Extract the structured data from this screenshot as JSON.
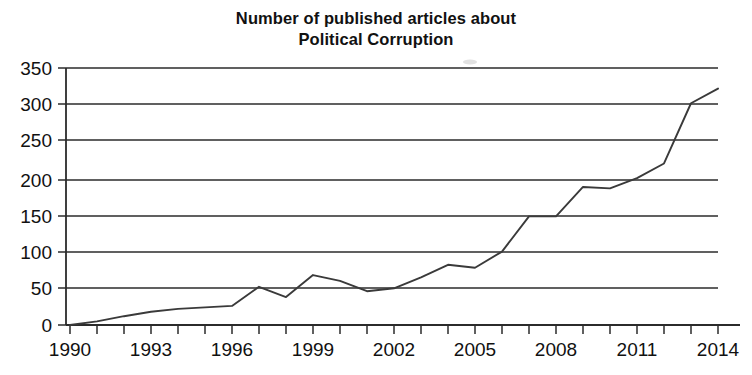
{
  "chart_data": {
    "type": "line",
    "title": "Number of published articles about Political Corruption",
    "title_lines": [
      "Number of published articles about",
      "Political Corruption"
    ],
    "xlabel": "",
    "ylabel": "",
    "x": [
      1990,
      1991,
      1992,
      1993,
      1994,
      1995,
      1996,
      1997,
      1998,
      1999,
      2000,
      2001,
      2002,
      2003,
      2004,
      2005,
      2006,
      2007,
      2008,
      2009,
      2010,
      2011,
      2012,
      2013,
      2014
    ],
    "values": [
      0,
      5,
      12,
      18,
      22,
      24,
      26,
      52,
      38,
      68,
      60,
      46,
      50,
      65,
      82,
      78,
      100,
      148,
      148,
      188,
      186,
      200,
      220,
      302,
      322
    ],
    "series": [
      {
        "name": "Published articles about Political Corruption",
        "values": [
          0,
          5,
          12,
          18,
          22,
          24,
          26,
          52,
          38,
          68,
          60,
          46,
          50,
          65,
          82,
          78,
          100,
          148,
          148,
          188,
          186,
          200,
          220,
          302,
          322
        ]
      }
    ],
    "xlim": [
      1990,
      2014
    ],
    "ylim": [
      0,
      350
    ],
    "y_ticks": [
      0,
      50,
      100,
      150,
      200,
      250,
      300,
      350
    ],
    "y_tick_labels": [
      "0",
      "50",
      "100",
      "150",
      "200",
      "250",
      "300",
      "350"
    ],
    "x_ticks": [
      1990,
      1991,
      1992,
      1993,
      1994,
      1995,
      1996,
      1997,
      1998,
      1999,
      2000,
      2001,
      2002,
      2003,
      2004,
      2005,
      2006,
      2007,
      2008,
      2009,
      2010,
      2011,
      2012,
      2013,
      2014
    ],
    "x_tick_labels": [
      "1990",
      "",
      "",
      "1993",
      "",
      "",
      "1996",
      "",
      "",
      "1999",
      "",
      "",
      "2002",
      "",
      "",
      "2005",
      "",
      "",
      "2008",
      "",
      "",
      "2011",
      "",
      "",
      "2014"
    ],
    "x_labeled_ticks": [
      "1990",
      "1993",
      "1996",
      "1999",
      "2002",
      "2005",
      "2008",
      "2011",
      "2014"
    ],
    "grid": "horizontal",
    "legend": "none",
    "line_color": "#3a3a3a",
    "axis_color": "#2b2b2b",
    "background_color": "#ffffff"
  }
}
